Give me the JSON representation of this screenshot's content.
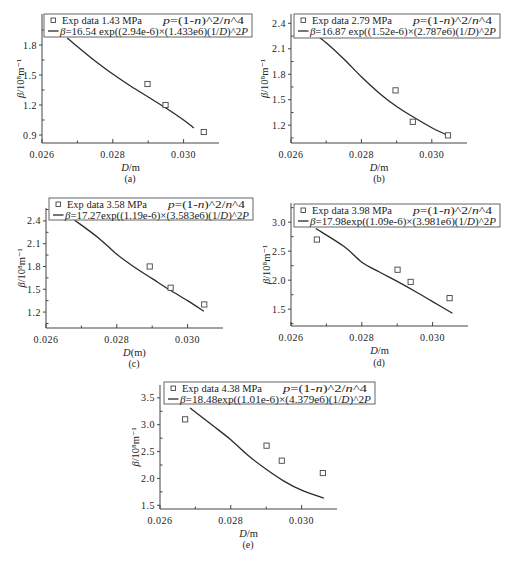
{
  "chart_data": [
    {
      "id": "a",
      "caption": "(a)",
      "type": "scatter",
      "title": "",
      "xlabel": "D/m",
      "ylabel": "β/10⁸m⁻¹",
      "xlim": [
        0.026,
        0.031
      ],
      "ylim": [
        0.82,
        2.11
      ],
      "xticks": [
        0.026,
        0.028,
        0.03
      ],
      "xtick_labels": [
        "0.026",
        "0.028",
        "0.030"
      ],
      "xminor": [
        0.027,
        0.029
      ],
      "yticks": [
        0.9,
        1.2,
        1.5,
        1.8
      ],
      "ytick_labels": [
        "0.9",
        "1.2",
        "1.5",
        "1.8"
      ],
      "grid": false,
      "legend_position": "top",
      "legend": {
        "exp_label": "Exp data 1.43 MPa",
        "model": "p=(1-n)^2/n^4",
        "fit_label": "β=16.54 exp((2.94e-6)×(1.433e6)(1/D)^2P"
      },
      "series": [
        {
          "name": "Exp data 1.43 MPa",
          "kind": "scatter",
          "marker": "open-square",
          "x": [
            0.02898,
            0.02949,
            0.03057
          ],
          "y": [
            1.41,
            1.2,
            0.93
          ]
        },
        {
          "name": "β=16.54 exp((2.94e-6)×(1.433e6)(1/D)^2P",
          "kind": "line",
          "x": [
            0.02671,
            0.0275,
            0.028,
            0.0285,
            0.029,
            0.0295,
            0.03,
            0.03029
          ],
          "y": [
            1.87,
            1.64,
            1.51,
            1.39,
            1.28,
            1.17,
            1.05,
            0.97
          ]
        }
      ]
    },
    {
      "id": "b",
      "caption": "(b)",
      "type": "scatter",
      "title": "",
      "xlabel": "D/m",
      "ylabel": "β/10⁸m⁻¹",
      "xlim": [
        0.026,
        0.031
      ],
      "ylim": [
        0.99,
        2.51
      ],
      "xticks": [
        0.026,
        0.028,
        0.03
      ],
      "xtick_labels": [
        "0.026",
        "0.028",
        "0.030"
      ],
      "xminor": [
        0.027,
        0.029
      ],
      "yticks": [
        1.2,
        1.5,
        1.8,
        2.1,
        2.4
      ],
      "ytick_labels": [
        "1.2",
        "1.5",
        "1.8",
        "2.1",
        "2.4"
      ],
      "grid": false,
      "legend_position": "top",
      "legend": {
        "exp_label": "Exp data 2.79 MPa",
        "model": "p=(1-n)^2/n^4",
        "fit_label": "β=16.87 exp((1.52e-6)×(2.787e6)(1/D)^2P"
      },
      "series": [
        {
          "name": "Exp data 2.79 MPa",
          "kind": "scatter",
          "marker": "open-square",
          "x": [
            0.02897,
            0.02946,
            0.03046
          ],
          "y": [
            1.61,
            1.24,
            1.08
          ]
        },
        {
          "name": "β=16.87 exp((1.52e-6)×(2.787e6)(1/D)^2P",
          "kind": "line",
          "x": [
            0.02663,
            0.027,
            0.0275,
            0.028,
            0.0285,
            0.029,
            0.0295,
            0.03,
            0.03045
          ],
          "y": [
            2.29,
            2.17,
            1.98,
            1.77,
            1.58,
            1.42,
            1.29,
            1.17,
            1.08
          ]
        }
      ]
    },
    {
      "id": "c",
      "caption": "(c)",
      "type": "scatter",
      "title": "",
      "xlabel": "D(m)",
      "ylabel": "β/10⁸m⁻¹",
      "xlim": [
        0.026,
        0.031
      ],
      "ylim": [
        0.99,
        2.57
      ],
      "xticks": [
        0.026,
        0.028,
        0.03
      ],
      "xtick_labels": [
        "0.026",
        "0.028",
        "0.030"
      ],
      "xminor": [
        0.027,
        0.029
      ],
      "yticks": [
        1.2,
        1.5,
        1.8,
        2.1,
        2.4
      ],
      "ytick_labels": [
        "1.2",
        "1.5",
        "1.8",
        "2.1",
        "2.4"
      ],
      "grid": false,
      "legend_position": "top",
      "legend": {
        "exp_label": "Exp data 3.58 MPa",
        "model": "p=(1-n)^2/n^4",
        "fit_label": "β=17.27exp((1.19e-6)×(3.583e6)(1/D)^2P"
      },
      "series": [
        {
          "name": "Exp data 3.58 MPa",
          "kind": "scatter",
          "marker": "open-square",
          "x": [
            0.02893,
            0.02952,
            0.03047
          ],
          "y": [
            1.8,
            1.52,
            1.3
          ]
        },
        {
          "name": "β=17.27exp((1.19e-6)×(3.583e6)(1/D)^2P",
          "kind": "line",
          "x": [
            0.02681,
            0.0275,
            0.028,
            0.0285,
            0.029,
            0.0295,
            0.03,
            0.03046
          ],
          "y": [
            2.41,
            2.17,
            1.96,
            1.79,
            1.64,
            1.49,
            1.35,
            1.21
          ]
        }
      ]
    },
    {
      "id": "d",
      "caption": "(d)",
      "type": "scatter",
      "title": "",
      "xlabel": "D/m",
      "ylabel": "β/10⁸m⁻¹",
      "xlim": [
        0.026,
        0.031
      ],
      "ylim": [
        1.21,
        3.33
      ],
      "xticks": [
        0.026,
        0.028,
        0.03
      ],
      "xtick_labels": [
        "0.026",
        "0.028",
        "0.030"
      ],
      "xminor": [
        0.027,
        0.029
      ],
      "yticks": [
        1.5,
        2.0,
        2.5,
        3.0
      ],
      "ytick_labels": [
        "1.5",
        "2.0",
        "2.5",
        "3.0"
      ],
      "grid": false,
      "legend_position": "top",
      "legend": {
        "exp_label": "Exp data 3.98 MPa",
        "model": "p=(1-n)^2/n^4",
        "fit_label": "β=17.98exp((1.09e-6)×(3.981e6)(1/D)^2P"
      },
      "series": [
        {
          "name": "Exp data 3.98 MPa",
          "kind": "scatter",
          "marker": "open-square",
          "x": [
            0.02673,
            0.02901,
            0.02938,
            0.03048
          ],
          "y": [
            2.7,
            2.18,
            1.97,
            1.69
          ]
        },
        {
          "name": "β=17.98exp((1.09e-6)×(3.981e6)(1/D)^2P",
          "kind": "line",
          "x": [
            0.0267,
            0.0275,
            0.028,
            0.0285,
            0.029,
            0.0295,
            0.03,
            0.03056
          ],
          "y": [
            2.89,
            2.58,
            2.31,
            2.14,
            1.98,
            1.81,
            1.63,
            1.43
          ]
        }
      ]
    },
    {
      "id": "e",
      "caption": "(e)",
      "type": "scatter",
      "title": "",
      "xlabel": "D/m",
      "ylabel": "β/10⁸m⁻¹",
      "xlim": [
        0.026,
        0.031
      ],
      "ylim": [
        1.43,
        3.74
      ],
      "xticks": [
        0.026,
        0.028,
        0.03
      ],
      "xtick_labels": [
        "0.026",
        "0.028",
        "0.030"
      ],
      "xminor": [
        0.027,
        0.029
      ],
      "yticks": [
        1.5,
        2.0,
        2.5,
        3.0,
        3.5
      ],
      "ytick_labels": [
        "1.5",
        "2.0",
        "2.5",
        "3.0",
        "3.5"
      ],
      "grid": false,
      "legend_position": "top",
      "legend": {
        "exp_label": "Exp data 4.38 MPa",
        "model": "p=(1-n)^2/n^4",
        "fit_label": "β=18.48exp((1.01e-6)×(4.379e6)(1/D)^2P"
      },
      "series": [
        {
          "name": "Exp data 4.38 MPa",
          "kind": "scatter",
          "marker": "open-square",
          "x": [
            0.02671,
            0.02901,
            0.02944,
            0.0306
          ],
          "y": [
            3.1,
            2.61,
            2.33,
            2.1
          ]
        },
        {
          "name": "β=18.48exp((1.01e-6)×(4.379e6)(1/D)^2P",
          "kind": "line",
          "x": [
            0.02685,
            0.0275,
            0.028,
            0.0285,
            0.029,
            0.0295,
            0.03,
            0.03063
          ],
          "y": [
            3.31,
            2.98,
            2.72,
            2.42,
            2.17,
            1.95,
            1.78,
            1.63
          ]
        }
      ]
    }
  ]
}
